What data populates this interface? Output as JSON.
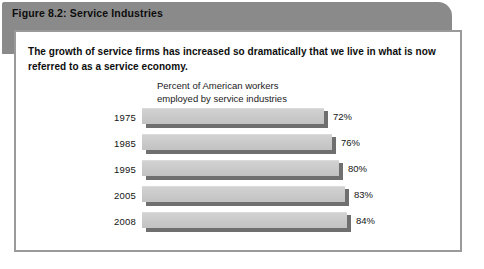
{
  "figure": {
    "title": "Figure 8.2:  Service Industries",
    "lead_text": "The growth of service firms has increased so dramatically that we live in what is now referred to as a service economy.",
    "caption": "Percent of American workers\nemployed by service industries"
  },
  "colors": {
    "header_gray": "#8a8a8a",
    "border_gray": "#9a9a9a",
    "bar_fill": "#c9c9c9",
    "bar_shadow": "#6f6f6f",
    "text": "#141414",
    "card_background": "#ffffff"
  },
  "chart_data": {
    "type": "bar",
    "orientation": "horizontal",
    "title": "Percent of American workers employed by service industries",
    "xlabel": "",
    "ylabel": "",
    "categories": [
      "1975",
      "1985",
      "1995",
      "2005",
      "2008"
    ],
    "values": [
      72,
      76,
      80,
      83,
      84
    ],
    "value_labels": [
      "72%",
      "76%",
      "80%",
      "83%",
      "84%"
    ],
    "unit": "%",
    "xlim": [
      0,
      100
    ],
    "grid": false,
    "legend": null
  },
  "bars": [
    {
      "year": "1975",
      "value": 72,
      "label": "72%"
    },
    {
      "year": "1985",
      "value": 76,
      "label": "76%"
    },
    {
      "year": "1995",
      "value": 80,
      "label": "80%"
    },
    {
      "year": "2005",
      "value": 83,
      "label": "83%"
    },
    {
      "year": "2008",
      "value": 84,
      "label": "84%"
    }
  ]
}
